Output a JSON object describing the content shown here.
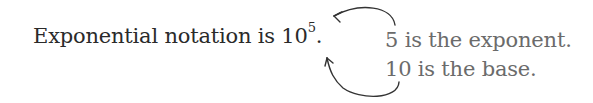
{
  "sentence": {
    "prefix": "Exponential notation is ",
    "base": "10",
    "exponent": "5",
    "suffix": "."
  },
  "annotations": {
    "exponent_note": "5 is the exponent.",
    "base_note": "10 is the base."
  },
  "colors": {
    "main_text": "#2a2a2a",
    "annotation_text": "#6b6b6b",
    "arrow": "#333333"
  }
}
